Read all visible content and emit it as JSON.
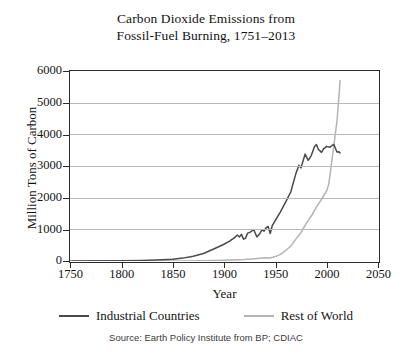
{
  "chart_data": {
    "type": "line",
    "title": "Carbon Dioxide Emissions from Fossil-Fuel Burning, 1751–2013",
    "title_lines": [
      "Carbon Dioxide Emissions from",
      "Fossil-Fuel Burning, 1751–2013"
    ],
    "xlabel": "Year",
    "ylabel": "Million Tons of Carbon",
    "xlim": [
      1750,
      2050
    ],
    "ylim": [
      0,
      6000
    ],
    "xticks": [
      1750,
      1800,
      1850,
      1900,
      1950,
      2000,
      2050
    ],
    "yticks": [
      0,
      1000,
      2000,
      3000,
      4000,
      5000,
      6000
    ],
    "grid": "horizontal",
    "legend_position": "below-axes",
    "source": "Source: Earth Policy Institute from BP; CDIAC",
    "colors": {
      "industrial": "#4a4a4a",
      "rest_of_world": "#b4b4b4",
      "axis": "#2b2b2b",
      "gridline": "#b9b9b9",
      "text": "#141414",
      "background": "#ffffff"
    },
    "series": [
      {
        "name": "Industrial Countries",
        "color": "#4a4a4a",
        "x": [
          1751,
          1800,
          1820,
          1840,
          1850,
          1860,
          1870,
          1880,
          1890,
          1900,
          1905,
          1910,
          1913,
          1915,
          1917,
          1919,
          1921,
          1923,
          1925,
          1929,
          1932,
          1935,
          1937,
          1939,
          1941,
          1943,
          1945,
          1947,
          1950,
          1955,
          1960,
          1965,
          1970,
          1973,
          1975,
          1979,
          1982,
          1985,
          1988,
          1990,
          1992,
          1995,
          1997,
          2000,
          2003,
          2005,
          2007,
          2008,
          2010,
          2012,
          2013
        ],
        "values": [
          3,
          8,
          17,
          40,
          54,
          91,
          147,
          236,
          380,
          530,
          620,
          730,
          820,
          760,
          840,
          690,
          720,
          880,
          900,
          990,
          760,
          870,
          980,
          940,
          1050,
          1090,
          870,
          1120,
          1280,
          1550,
          1860,
          2180,
          2760,
          3020,
          2940,
          3380,
          3180,
          3330,
          3600,
          3680,
          3520,
          3430,
          3540,
          3620,
          3590,
          3640,
          3680,
          3600,
          3440,
          3450,
          3410
        ]
      },
      {
        "name": "Rest of World",
        "color": "#b4b4b4",
        "x": [
          1751,
          1850,
          1880,
          1900,
          1920,
          1930,
          1940,
          1945,
          1950,
          1955,
          1960,
          1965,
          1970,
          1975,
          1980,
          1985,
          1990,
          1995,
          2000,
          2002,
          2004,
          2006,
          2008,
          2010,
          2012,
          2013
        ],
        "values": [
          0,
          2,
          8,
          20,
          45,
          70,
          100,
          95,
          140,
          210,
          330,
          470,
          690,
          900,
          1180,
          1420,
          1700,
          1950,
          2220,
          2420,
          2900,
          3400,
          3900,
          4400,
          5200,
          5700
        ]
      }
    ]
  },
  "axes": {
    "y_title": "Million Tons of Carbon",
    "x_title": "Year",
    "y_tick_labels": [
      "6000",
      "5000",
      "4000",
      "3000",
      "2000",
      "1000",
      "0"
    ],
    "x_tick_labels": [
      "1750",
      "1800",
      "1850",
      "1900",
      "1950",
      "2000",
      "2050"
    ]
  },
  "legend": {
    "entries": [
      {
        "label": "Industrial Countries",
        "color": "#4a4a4a"
      },
      {
        "label": "Rest of World",
        "color": "#b4b4b4"
      }
    ]
  },
  "footer": {
    "source": "Source: Earth Policy Institute from BP; CDIAC"
  }
}
